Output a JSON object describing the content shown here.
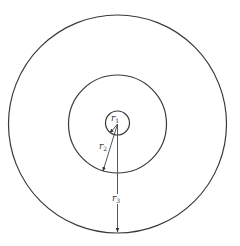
{
  "diagram": {
    "title": "",
    "type": "concentric-circles",
    "center": {
      "x": 117.5,
      "y": 124
    },
    "circles": [
      {
        "id": "inner",
        "radius": 12
      },
      {
        "id": "middle",
        "radius": 49
      },
      {
        "id": "outer",
        "radius": 109
      }
    ],
    "radii": [
      {
        "id": "r1",
        "var": "r",
        "sub": "1"
      },
      {
        "id": "r2",
        "var": "r",
        "sub": "2"
      },
      {
        "id": "r3",
        "var": "r",
        "sub": "3"
      }
    ],
    "colors": {
      "stroke": "#3a3a3a",
      "background": "#ffffff"
    }
  }
}
